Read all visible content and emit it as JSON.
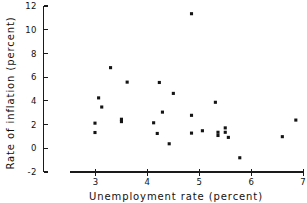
{
  "chart_data": {
    "type": "scatter",
    "title": "",
    "xlabel": "Unemployment rate (percent)",
    "ylabel": "Rate of inflation (percent)",
    "xlim": [
      2.5,
      7.0
    ],
    "ylim": [
      -2,
      12
    ],
    "xticks": [
      3,
      4,
      5,
      6,
      7
    ],
    "yticks": [
      -2,
      0,
      2,
      4,
      6,
      8,
      10,
      12
    ],
    "xtick_labels": [
      "3",
      "4",
      "5",
      "6",
      "7"
    ],
    "ytick_labels": [
      "-2",
      "0",
      "2",
      "4",
      "6",
      "8",
      "10",
      "12"
    ],
    "grid": false,
    "legend": null,
    "marker": "filled-square",
    "marker_color": "#141414",
    "axis_color": "#1a1a1a",
    "background_color": "#ffffff",
    "points": [
      {
        "x": 2.99,
        "y": 2.12
      },
      {
        "x": 2.99,
        "y": 1.33
      },
      {
        "x": 3.06,
        "y": 4.25
      },
      {
        "x": 3.12,
        "y": 3.48
      },
      {
        "x": 3.29,
        "y": 6.8
      },
      {
        "x": 3.5,
        "y": 2.45
      },
      {
        "x": 3.5,
        "y": 2.25
      },
      {
        "x": 3.61,
        "y": 5.58
      },
      {
        "x": 4.12,
        "y": 2.15
      },
      {
        "x": 4.19,
        "y": 1.25
      },
      {
        "x": 4.23,
        "y": 5.55
      },
      {
        "x": 4.29,
        "y": 3.05
      },
      {
        "x": 4.42,
        "y": 0.38
      },
      {
        "x": 4.5,
        "y": 4.63
      },
      {
        "x": 4.85,
        "y": 11.35
      },
      {
        "x": 4.85,
        "y": 2.78
      },
      {
        "x": 4.85,
        "y": 1.28
      },
      {
        "x": 5.06,
        "y": 1.48
      },
      {
        "x": 5.31,
        "y": 3.88
      },
      {
        "x": 5.36,
        "y": 1.35
      },
      {
        "x": 5.36,
        "y": 1.08
      },
      {
        "x": 5.5,
        "y": 1.72
      },
      {
        "x": 5.5,
        "y": 1.35
      },
      {
        "x": 5.56,
        "y": 0.92
      },
      {
        "x": 5.78,
        "y": -0.8
      },
      {
        "x": 6.6,
        "y": 0.98
      },
      {
        "x": 6.86,
        "y": 2.38
      }
    ]
  }
}
